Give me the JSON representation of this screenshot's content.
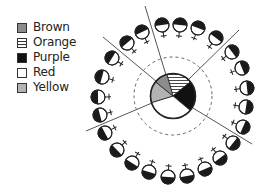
{
  "legend": {
    "items": [
      {
        "label": "Brown",
        "fill": "#8c8c8c",
        "pattern": "solid"
      },
      {
        "label": "Orange",
        "fill": "#ffffff",
        "pattern": "stripes"
      },
      {
        "label": "Purple",
        "fill": "#111111",
        "pattern": "solid"
      },
      {
        "label": "Red",
        "fill": "#ffffff",
        "pattern": "solid"
      },
      {
        "label": "Yellow",
        "fill": "#b3b3b3",
        "pattern": "solid"
      }
    ]
  },
  "diagram": {
    "center": [
      173,
      96
    ],
    "pie": {
      "radius": 22.5,
      "slices": [
        {
          "label": "Orange",
          "start_deg": 344,
          "end_deg": 411,
          "fill": "#ffffff",
          "pattern": "stripes"
        },
        {
          "label": "Purple",
          "start_deg": 51,
          "end_deg": 130,
          "fill": "#111111",
          "pattern": "solid"
        },
        {
          "label": "Red",
          "start_deg": 130,
          "end_deg": 253,
          "fill": "#ffffff",
          "pattern": "solid"
        },
        {
          "label": "Yellow",
          "start_deg": 253,
          "end_deg": 309,
          "fill": "#b3b3b3",
          "pattern": "solid"
        },
        {
          "label": "Brown",
          "start_deg": 309,
          "end_deg": 344,
          "fill": "#8c8c8c",
          "pattern": "solid"
        }
      ]
    },
    "dashed_circle": {
      "radius": 39
    },
    "divider_lines": [
      {
        "from": [
          145,
          6
        ],
        "to": [
          166,
          75
        ]
      },
      {
        "from": [
          239,
          30
        ],
        "to": [
          189,
          79
        ]
      },
      {
        "from": [
          252,
          144
        ],
        "to": [
          193,
          108
        ]
      },
      {
        "from": [
          86,
          131
        ],
        "to": [
          152,
          103
        ]
      },
      {
        "from": [
          103,
          37
        ],
        "to": [
          157,
          82
        ]
      }
    ],
    "ring": {
      "count": 24,
      "symbol": "female-symbol-half-filled",
      "symbol_radius": 7,
      "positions": [
        [
          162,
          25
        ],
        [
          180,
          25
        ],
        [
          198,
          28
        ],
        [
          216,
          38
        ],
        [
          232,
          52
        ],
        [
          242,
          68
        ],
        [
          247,
          88
        ],
        [
          246,
          107
        ],
        [
          243,
          127
        ],
        [
          233,
          143
        ],
        [
          220,
          158
        ],
        [
          205,
          169
        ],
        [
          187,
          176
        ],
        [
          168,
          177
        ],
        [
          149,
          172
        ],
        [
          132,
          163
        ],
        [
          117,
          150
        ],
        [
          105,
          133
        ],
        [
          100,
          115
        ],
        [
          98,
          97
        ],
        [
          102,
          77
        ],
        [
          112,
          58
        ],
        [
          127,
          43
        ],
        [
          142,
          32
        ]
      ]
    },
    "colors": {
      "stroke": "#222222",
      "line": "#555555",
      "dashed": "#666666"
    }
  }
}
